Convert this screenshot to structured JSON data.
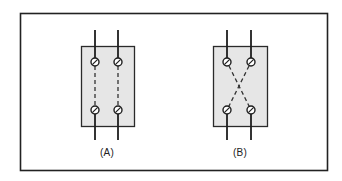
{
  "figure": {
    "type": "wiring-diagram",
    "colors": {
      "frame": "#222222",
      "block_fill": "#e6e6e6",
      "block_stroke": "#2a2a2a",
      "wire": "#1e1e1e",
      "screw_fill": "#ffffff"
    },
    "panels": [
      {
        "id": "A",
        "label": "(A)",
        "connection": "straight",
        "description": "Two parallel dashed jumpers connecting top terminals directly to bottom terminals"
      },
      {
        "id": "B",
        "label": "(B)",
        "connection": "crossed",
        "description": "Two dashed jumpers crossing diagonally, connecting top-left to bottom-right and top-right to bottom-left"
      }
    ]
  }
}
